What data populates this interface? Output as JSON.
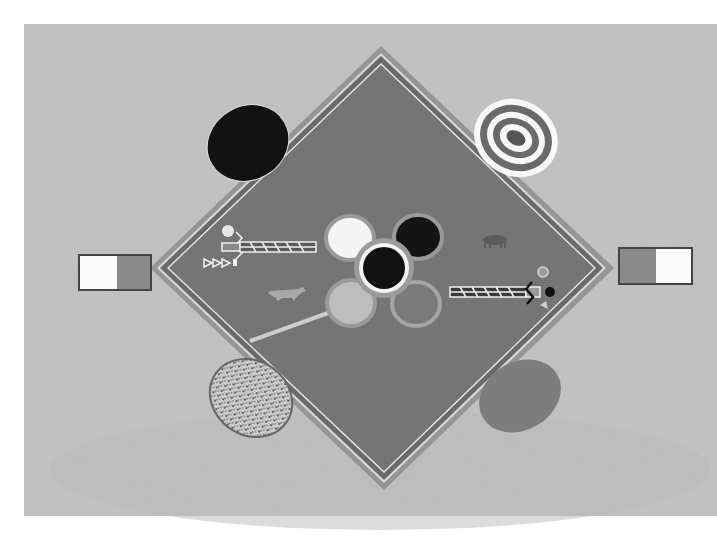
{
  "artwork": {
    "type": "sand-painting style artwork (grayscale photograph)",
    "colors": {
      "page": "#ffffff",
      "ground": "#c4c4c4",
      "diamond_field": "#7a7a7a",
      "diamond_border_outer": "#8e8e8e",
      "border_line": "#e8e8e8",
      "black": "#141414",
      "white": "#f7f7f7",
      "mid_gray": "#888888",
      "light_gray": "#bdbdbd"
    },
    "elements": [
      "central-diamond",
      "four-petal-flower",
      "black-center-disc",
      "black-oval-top-left",
      "concentric-ring-oval-top-right",
      "speckled-oval-bottom-left",
      "gray-oval-bottom-right",
      "left-rectangle-white-gray",
      "right-rectangle-gray-white",
      "figure-left",
      "figure-right",
      "coyote-figure",
      "small-animal-figure",
      "diagonal-path-line"
    ]
  }
}
